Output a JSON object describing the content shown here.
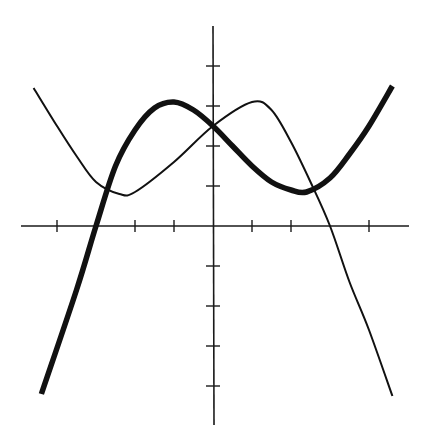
{
  "chart_data": {
    "type": "line",
    "title": "",
    "xlabel": "",
    "ylabel": "",
    "grid": false,
    "legend": null,
    "axes": {
      "origin_px": [
        213,
        226
      ],
      "unit_px_x": 39,
      "unit_px_y": 40,
      "xlim": [
        -4.9,
        5.0
      ],
      "ylim": [
        -5.0,
        5.0
      ],
      "x_ticks": [
        -4,
        -2,
        -1,
        1,
        2,
        4
      ],
      "y_ticks": [
        -4,
        -3,
        -2,
        -1,
        1,
        2,
        3,
        4
      ],
      "tick_labels_shown": false
    },
    "series": [
      {
        "name": "thin curve",
        "style": "thin",
        "color": "#111111",
        "points": [
          [
            -4.6,
            3.45
          ],
          [
            -4.0,
            2.5
          ],
          [
            -3.5,
            1.75
          ],
          [
            -3.0,
            1.1
          ],
          [
            -2.4,
            0.8
          ],
          [
            -2.0,
            0.85
          ],
          [
            -1.0,
            1.6
          ],
          [
            0.0,
            2.5
          ],
          [
            1.0,
            3.1
          ],
          [
            1.5,
            2.9
          ],
          [
            2.0,
            2.1
          ],
          [
            2.5,
            1.1
          ],
          [
            3.0,
            0.0
          ],
          [
            3.5,
            -1.4
          ],
          [
            4.0,
            -2.6
          ],
          [
            4.6,
            -4.25
          ]
        ]
      },
      {
        "name": "thick curve",
        "style": "thick",
        "color": "#111111",
        "points": [
          [
            -4.4,
            -4.2
          ],
          [
            -3.5,
            -1.6
          ],
          [
            -3.0,
            0.0
          ],
          [
            -2.5,
            1.5
          ],
          [
            -2.0,
            2.4
          ],
          [
            -1.5,
            2.95
          ],
          [
            -1.0,
            3.1
          ],
          [
            -0.5,
            2.9
          ],
          [
            0.0,
            2.5
          ],
          [
            0.5,
            2.0
          ],
          [
            1.0,
            1.5
          ],
          [
            1.5,
            1.1
          ],
          [
            2.0,
            0.9
          ],
          [
            2.4,
            0.85
          ],
          [
            3.0,
            1.2
          ],
          [
            3.5,
            1.8
          ],
          [
            4.0,
            2.5
          ],
          [
            4.6,
            3.5
          ]
        ]
      }
    ],
    "intersections": [
      {
        "x": -2.5,
        "y": 0.85
      },
      {
        "x": 0.0,
        "y": 2.5
      },
      {
        "x": 2.6,
        "y": 0.9
      }
    ]
  }
}
